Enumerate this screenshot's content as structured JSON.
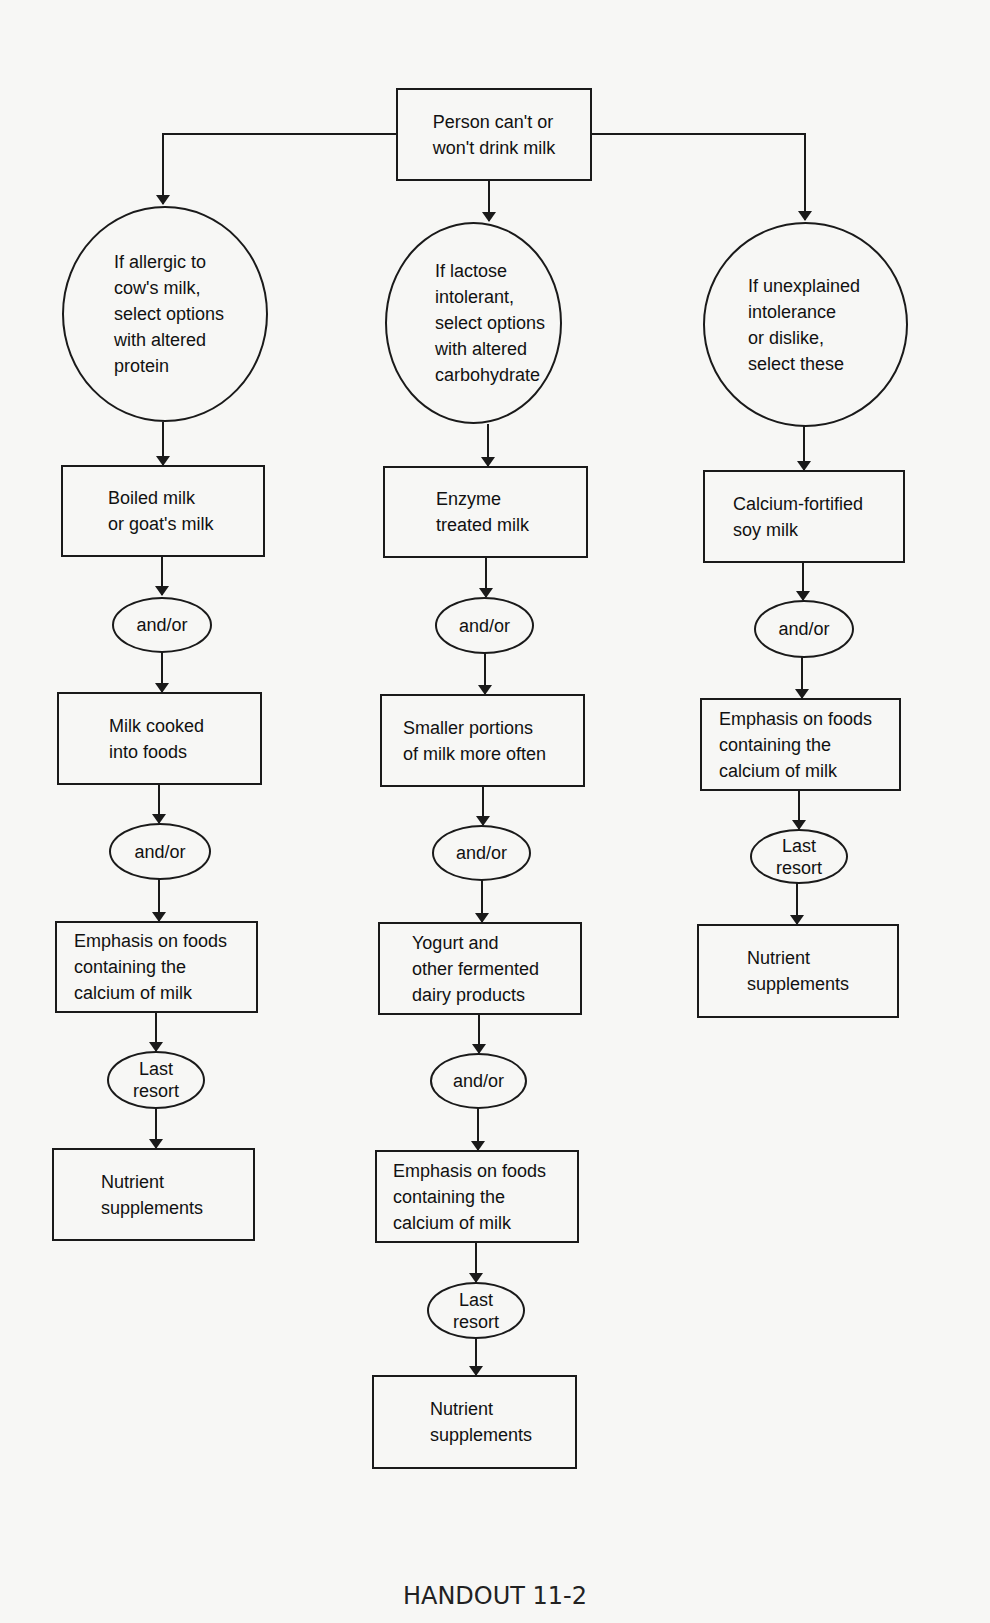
{
  "diagram": {
    "root": {
      "lines": [
        "Person can't or",
        "won't drink milk"
      ]
    },
    "branches": [
      {
        "condition": {
          "lines": [
            "If allergic to",
            "cow's milk,",
            "select options",
            "with altered",
            "protein"
          ]
        },
        "steps": [
          {
            "type": "box",
            "lines": [
              "Boiled milk",
              "or goat's milk"
            ]
          },
          {
            "type": "connector",
            "lines": [
              "and/or"
            ]
          },
          {
            "type": "box",
            "lines": [
              "Milk cooked",
              "into foods"
            ]
          },
          {
            "type": "connector",
            "lines": [
              "and/or"
            ]
          },
          {
            "type": "box",
            "lines": [
              "Emphasis on foods",
              "containing the",
              "calcium of milk"
            ]
          },
          {
            "type": "connector",
            "lines": [
              "Last",
              "resort"
            ]
          },
          {
            "type": "box",
            "lines": [
              "Nutrient",
              "supplements"
            ]
          }
        ]
      },
      {
        "condition": {
          "lines": [
            "If lactose",
            "intolerant,",
            "select options",
            "with altered",
            "carbohydrate"
          ]
        },
        "steps": [
          {
            "type": "box",
            "lines": [
              "Enzyme",
              "treated milk"
            ]
          },
          {
            "type": "connector",
            "lines": [
              "and/or"
            ]
          },
          {
            "type": "box",
            "lines": [
              "Smaller portions",
              "of milk more often"
            ]
          },
          {
            "type": "connector",
            "lines": [
              "and/or"
            ]
          },
          {
            "type": "box",
            "lines": [
              "Yogurt and",
              "other fermented",
              "dairy products"
            ]
          },
          {
            "type": "connector",
            "lines": [
              "and/or"
            ]
          },
          {
            "type": "box",
            "lines": [
              "Emphasis on foods",
              "containing the",
              "calcium of milk"
            ]
          },
          {
            "type": "connector",
            "lines": [
              "Last",
              "resort"
            ]
          },
          {
            "type": "box",
            "lines": [
              "Nutrient",
              "supplements"
            ]
          }
        ]
      },
      {
        "condition": {
          "lines": [
            "If unexplained",
            "intolerance",
            "or dislike,",
            "select these"
          ]
        },
        "steps": [
          {
            "type": "box",
            "lines": [
              "Calcium-fortified",
              "soy milk"
            ]
          },
          {
            "type": "connector",
            "lines": [
              "and/or"
            ]
          },
          {
            "type": "box",
            "lines": [
              "Emphasis on foods",
              "containing the",
              "calcium of milk"
            ]
          },
          {
            "type": "connector",
            "lines": [
              "Last",
              "resort"
            ]
          },
          {
            "type": "box",
            "lines": [
              "Nutrient",
              "supplements"
            ]
          }
        ]
      }
    ]
  },
  "footer": {
    "label": "HANDOUT 11-2"
  },
  "colors": {
    "stroke": "#1a1a1a",
    "paper": "#f7f7f5",
    "text": "#111111"
  }
}
